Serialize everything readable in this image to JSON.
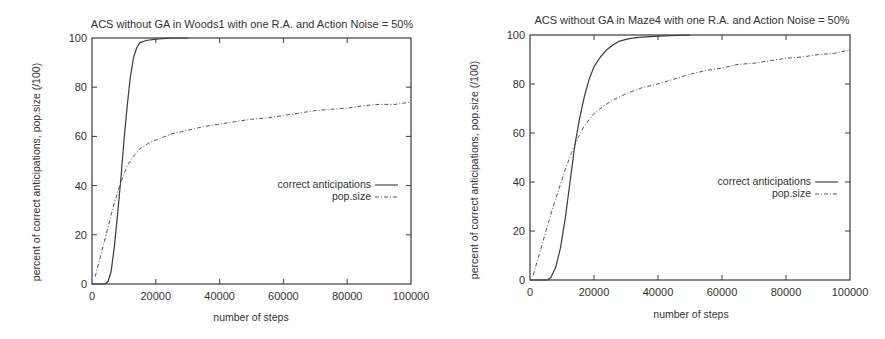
{
  "chart_data": [
    {
      "type": "line",
      "title": "ACS without GA in Woods1 with one R.A. and Action Noise = 50%",
      "xlabel": "number of steps",
      "ylabel": "percent of correct anticipations, pop.size (/100)",
      "xlim": [
        0,
        100000
      ],
      "ylim": [
        0,
        100
      ],
      "xticks": [
        "0",
        "20000",
        "40000",
        "60000",
        "80000",
        "100000"
      ],
      "yticks": [
        "0",
        "20",
        "40",
        "60",
        "80",
        "100"
      ],
      "grid": false,
      "legend_position": "right-middle",
      "series": [
        {
          "name": "correct anticipations",
          "style": "solid",
          "x": [
            0,
            4000,
            5000,
            6000,
            7000,
            8000,
            9000,
            10000,
            11000,
            12000,
            13000,
            14000,
            15000,
            17000,
            20000,
            25000,
            30000
          ],
          "y": [
            0,
            0,
            1,
            5,
            15,
            28,
            42,
            58,
            72,
            84,
            92,
            96,
            98,
            99,
            99.5,
            100,
            100
          ]
        },
        {
          "name": "pop.size",
          "style": "dash-dot",
          "x": [
            1000,
            3000,
            5000,
            7000,
            9000,
            11000,
            13000,
            15000,
            18000,
            20000,
            25000,
            30000,
            35000,
            40000,
            45000,
            50000,
            55000,
            60000,
            65000,
            70000,
            75000,
            80000,
            85000,
            90000,
            95000,
            100000
          ],
          "y": [
            3,
            13,
            23,
            33,
            41,
            48,
            52,
            55,
            57.5,
            58.5,
            61,
            62.5,
            64,
            65,
            66,
            67,
            67.5,
            68.5,
            69.5,
            70.5,
            71,
            71.5,
            72.5,
            73,
            73,
            74
          ]
        }
      ]
    },
    {
      "type": "line",
      "title": "ACS without GA in Maze4 with one R.A. and Action Noise = 50%",
      "xlabel": "number of steps",
      "ylabel": "percent of correct anticipations, pop.size (/100)",
      "xlim": [
        0,
        100000
      ],
      "ylim": [
        0,
        100
      ],
      "xticks": [
        "0",
        "20000",
        "40000",
        "60000",
        "80000",
        "100000"
      ],
      "yticks": [
        "0",
        "20",
        "40",
        "60",
        "80",
        "100"
      ],
      "grid": false,
      "legend_position": "right-middle",
      "series": [
        {
          "name": "correct anticipations",
          "style": "solid",
          "x": [
            0,
            5500,
            6500,
            8000,
            9500,
            11000,
            12500,
            14000,
            15500,
            17000,
            18500,
            20000,
            22000,
            24000,
            26000,
            28000,
            31000,
            34000,
            40000,
            50000
          ],
          "y": [
            0,
            0,
            1,
            5,
            13,
            25,
            40,
            55,
            66,
            75,
            82,
            87,
            91,
            94,
            96,
            97.5,
            98.5,
            99,
            99.5,
            100
          ]
        },
        {
          "name": "pop.size",
          "style": "dash-dot",
          "x": [
            1000,
            3000,
            5000,
            7000,
            9000,
            11000,
            13000,
            15000,
            17000,
            20000,
            23000,
            26000,
            30000,
            35000,
            40000,
            45000,
            50000,
            55000,
            60000,
            65000,
            70000,
            75000,
            80000,
            85000,
            90000,
            95000,
            100000
          ],
          "y": [
            2,
            11,
            20,
            29,
            37,
            45,
            52,
            58,
            63,
            68,
            71,
            73.5,
            76,
            78.5,
            80,
            82,
            84,
            85.5,
            86.5,
            88,
            88.5,
            89.5,
            90.5,
            91,
            92,
            92.5,
            94
          ]
        }
      ]
    }
  ],
  "charts": [
    {
      "title": "ACS without GA in Woods1 with one R.A. and Action Noise = 50%",
      "xlabel": "number of steps",
      "ylabel": "percent of correct anticipations, pop.size (/100)",
      "legend": [
        "correct anticipations",
        "pop.size"
      ],
      "xticks": [
        "0",
        "20000",
        "40000",
        "60000",
        "80000",
        "100000"
      ],
      "yticks": [
        "0",
        "20",
        "40",
        "60",
        "80",
        "100"
      ]
    },
    {
      "title": "ACS without GA in Maze4 with one R.A. and Action Noise = 50%",
      "xlabel": "number of steps",
      "ylabel": "percent of correct anticipations, pop.size (/100)",
      "legend": [
        "correct anticipations",
        "pop.size"
      ],
      "xticks": [
        "0",
        "20000",
        "40000",
        "60000",
        "80000",
        "100000"
      ],
      "yticks": [
        "0",
        "20",
        "40",
        "60",
        "80",
        "100"
      ]
    }
  ],
  "colors": {
    "ink": "#3a3a3a",
    "background": "#ffffff"
  }
}
